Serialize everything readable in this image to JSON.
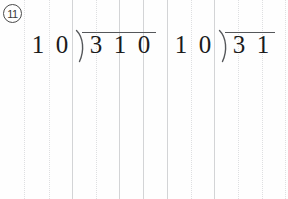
{
  "worksheet": {
    "problem_number": "11",
    "ink_color": "#1b1b1b",
    "rule_color": "#d3d4d6",
    "bracket_color": "#55575a",
    "background_color": "#fefefe"
  },
  "grid": {
    "description": "vertical ruled guide columns",
    "lines": [
      {
        "x": 24,
        "style": "dotted"
      },
      {
        "x": 49,
        "style": "dotted"
      },
      {
        "x": 72,
        "style": "solid"
      },
      {
        "x": 96,
        "style": "dotted"
      },
      {
        "x": 119,
        "style": "solid"
      },
      {
        "x": 143,
        "style": "solid"
      },
      {
        "x": 167,
        "style": "solid"
      },
      {
        "x": 191,
        "style": "dotted"
      },
      {
        "x": 214,
        "style": "solid"
      },
      {
        "x": 238,
        "style": "dotted"
      },
      {
        "x": 262,
        "style": "dotted"
      },
      {
        "x": 285,
        "style": "dotted"
      }
    ]
  },
  "problems": [
    {
      "id": "problem-1",
      "expression": "310 ÷ 10",
      "divisor_digits": [
        "1",
        "0"
      ],
      "dividend_digits": [
        "3",
        "1",
        "0"
      ],
      "bracket_glyph": ")",
      "quotient_digits": [],
      "left": 26,
      "top": 31,
      "divisor_x": [
        0,
        24
      ],
      "bracket_x": 48,
      "dividend_x": [
        58,
        82,
        106
      ],
      "vinculum_left": 56,
      "vinculum_width": 74,
      "vinculum_top": 1
    },
    {
      "id": "problem-2",
      "expression": "31 ÷ 10",
      "divisor_digits": [
        "1",
        "0"
      ],
      "dividend_digits": [
        "3",
        "1"
      ],
      "bracket_glyph": ")",
      "quotient_digits": [],
      "left": 169,
      "top": 31,
      "divisor_x": [
        0,
        24
      ],
      "bracket_x": 48,
      "dividend_x": [
        58,
        82
      ],
      "vinculum_left": 56,
      "vinculum_width": 50,
      "vinculum_top": 1
    }
  ]
}
